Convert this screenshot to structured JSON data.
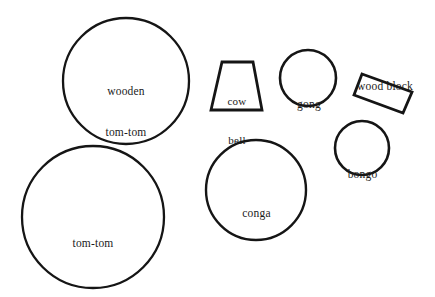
{
  "figure": {
    "background_color": "#ffffff",
    "stroke_color": "#151515",
    "canvas": {
      "width": 435,
      "height": 297
    }
  },
  "shapes": [
    {
      "id": "wooden-tom-tom",
      "label": "wooden\ntom-tom",
      "label_lines": [
        "wooden",
        "tom-tom"
      ],
      "geometry": "circle",
      "cx": 126,
      "cy": 81,
      "r": 63,
      "stroke_width": 2.3
    },
    {
      "id": "tom-tom",
      "label": "tom-tom",
      "label_lines": [
        "tom-tom"
      ],
      "geometry": "circle",
      "cx": 93,
      "cy": 217,
      "r": 71,
      "stroke_width": 2.3
    },
    {
      "id": "cow-bell",
      "label": "cow\nbell",
      "label_lines": [
        "cow",
        "bell"
      ],
      "geometry": "trapezoid",
      "points": "222,62 253,62 262,110 211,110",
      "stroke_width": 2.8
    },
    {
      "id": "gong",
      "label": "gong",
      "label_lines": [
        "gong"
      ],
      "geometry": "circle",
      "cx": 308,
      "cy": 78,
      "r": 28,
      "stroke_width": 2.6
    },
    {
      "id": "wood-block",
      "label": "wood block",
      "label_lines": [
        "wood block"
      ],
      "geometry": "rotated-rectangle",
      "points": "362,74 412,92 403,113 354,95",
      "stroke_width": 2.8
    },
    {
      "id": "bongo",
      "label": "bongo",
      "label_lines": [
        "bongo"
      ],
      "geometry": "circle",
      "cx": 362,
      "cy": 148,
      "r": 27,
      "stroke_width": 2.6
    },
    {
      "id": "conga",
      "label": "conga",
      "label_lines": [
        "conga"
      ],
      "geometry": "circle",
      "cx": 256,
      "cy": 190,
      "r": 50,
      "stroke_width": 2.4
    }
  ],
  "labels": {
    "wooden_tom_tom_line1": "wooden",
    "wooden_tom_tom_line2": "tom-tom",
    "tom_tom": "tom-tom",
    "cow_bell_line1": "cow",
    "cow_bell_line2": "bell",
    "gong": "gong",
    "wood_block": "wood block",
    "bongo": "bongo",
    "conga": "conga"
  }
}
